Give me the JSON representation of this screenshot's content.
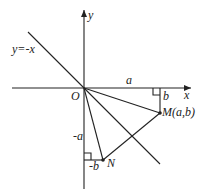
{
  "diagram": {
    "type": "coordinate-geometry",
    "axes": {
      "x_label": "x",
      "y_label": "y",
      "origin_label": "O"
    },
    "line_label": "y=-x",
    "points": {
      "M": {
        "label": "M(a,b)"
      },
      "N": {
        "label": "N"
      }
    },
    "segment_labels": {
      "a": "a",
      "b": "b",
      "neg_a": "-a",
      "neg_b": "-b"
    }
  }
}
